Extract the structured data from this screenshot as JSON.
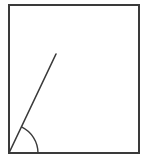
{
  "diagram": {
    "stroke_color": "#3a3a3a",
    "background": "#ffffff",
    "rectangle": {
      "x": 9,
      "y": 5,
      "width": 130,
      "height": 148,
      "stroke_width": 2
    },
    "ray": {
      "x1": 9,
      "y1": 153,
      "x2": 56,
      "y2": 54,
      "stroke_width": 1.6
    },
    "angle_arc": {
      "cx": 9,
      "cy": 153,
      "r": 29,
      "start_deg": 0,
      "end_deg": 64.6,
      "stroke_width": 1.4
    },
    "labels": []
  }
}
